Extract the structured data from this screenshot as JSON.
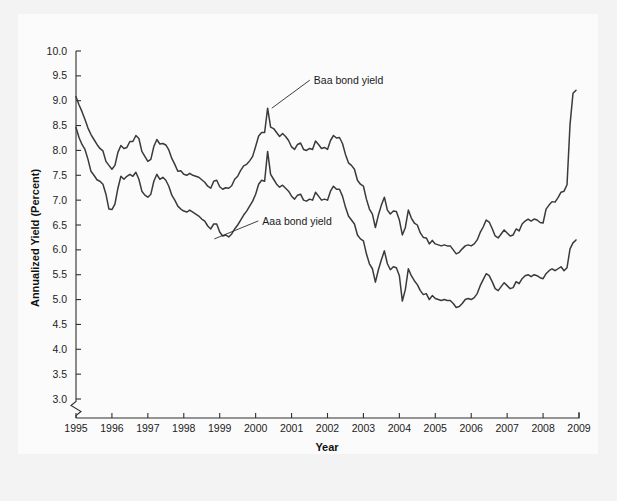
{
  "figure": {
    "background_color": "#f3f3f3",
    "plot_background_color": "#fdfdfd",
    "line_color": "#3a3a3a",
    "axis_color": "#2f2f2f"
  },
  "chart_data": {
    "type": "line",
    "title": "",
    "xlabel": "Year",
    "ylabel": "Annualized Yield (Percent)",
    "xlim": [
      1995,
      2009
    ],
    "ylim": [
      2.75,
      10.0
    ],
    "y_axis_break": true,
    "y_axis_break_below": 3.0,
    "grid": false,
    "legend_position": "inline-annotations",
    "xticks": [
      1995,
      1996,
      1997,
      1998,
      1999,
      2000,
      2001,
      2002,
      2003,
      2004,
      2005,
      2006,
      2007,
      2008,
      2009
    ],
    "xtick_labels": [
      "1995",
      "1996",
      "1997",
      "1998",
      "1999",
      "2000",
      "2001",
      "2002",
      "2003",
      "2004",
      "2005",
      "2006",
      "2007",
      "2008",
      "2009"
    ],
    "yticks": [
      3.0,
      3.5,
      4.0,
      4.5,
      5.0,
      5.5,
      6.0,
      6.5,
      7.0,
      7.5,
      8.0,
      8.5,
      9.0,
      9.5,
      10.0
    ],
    "ytick_labels": [
      "3.0",
      "3.5",
      "4.0",
      "4.5",
      "5.0",
      "5.5",
      "6.0",
      "6.5",
      "7.0",
      "7.5",
      "8.0",
      "8.5",
      "9.0",
      "9.5",
      "10.0"
    ],
    "annotations": [
      {
        "text": "Baa bond yield",
        "series": "Baa bond yield",
        "x": 2000.45,
        "y": 8.85
      },
      {
        "text": "Aaa bond yield",
        "series": "Aaa bond yield",
        "x": 1998.85,
        "y": 6.22
      }
    ],
    "x_start": 1995.0,
    "x_step_months": 1,
    "series": [
      {
        "name": "Baa bond yield",
        "values": [
          9.08,
          8.92,
          8.78,
          8.62,
          8.45,
          8.32,
          8.22,
          8.12,
          8.04,
          7.99,
          7.78,
          7.7,
          7.62,
          7.7,
          7.96,
          8.1,
          8.04,
          8.06,
          8.18,
          8.18,
          8.3,
          8.24,
          7.98,
          7.88,
          7.78,
          7.82,
          8.08,
          8.22,
          8.13,
          8.14,
          8.11,
          8.01,
          7.84,
          7.72,
          7.58,
          7.59,
          7.52,
          7.5,
          7.54,
          7.5,
          7.48,
          7.46,
          7.41,
          7.36,
          7.28,
          7.24,
          7.38,
          7.4,
          7.27,
          7.22,
          7.25,
          7.24,
          7.29,
          7.42,
          7.48,
          7.6,
          7.69,
          7.72,
          7.79,
          7.88,
          8.08,
          8.29,
          8.36,
          8.36,
          8.85,
          8.47,
          8.44,
          8.36,
          8.28,
          8.34,
          8.28,
          8.2,
          8.07,
          8.02,
          8.12,
          8.15,
          8.02,
          8.0,
          8.04,
          8.02,
          8.19,
          8.12,
          8.04,
          8.06,
          8.02,
          8.2,
          8.3,
          8.25,
          8.26,
          8.14,
          7.92,
          7.75,
          7.7,
          7.62,
          7.4,
          7.32,
          7.28,
          7.02,
          6.82,
          6.72,
          6.45,
          6.7,
          6.9,
          7.06,
          6.8,
          6.72,
          6.78,
          6.77,
          6.6,
          6.3,
          6.45,
          6.8,
          6.64,
          6.54,
          6.5,
          6.34,
          6.25,
          6.24,
          6.12,
          6.19,
          6.12,
          6.1,
          6.08,
          6.1,
          6.08,
          6.08,
          6.0,
          5.92,
          5.95,
          6.02,
          6.08,
          6.1,
          6.08,
          6.12,
          6.2,
          6.35,
          6.46,
          6.6,
          6.56,
          6.43,
          6.28,
          6.24,
          6.32,
          6.4,
          6.34,
          6.28,
          6.3,
          6.42,
          6.38,
          6.52,
          6.58,
          6.62,
          6.58,
          6.62,
          6.6,
          6.55,
          6.54,
          6.82,
          6.9,
          6.97,
          6.96,
          7.05,
          7.16,
          7.18,
          7.31,
          8.52,
          9.15,
          9.21
        ]
      },
      {
        "name": "Aaa bond yield",
        "values": [
          8.46,
          8.26,
          8.12,
          8.02,
          7.82,
          7.58,
          7.5,
          7.41,
          7.38,
          7.32,
          7.12,
          6.82,
          6.81,
          6.92,
          7.24,
          7.48,
          7.42,
          7.48,
          7.52,
          7.48,
          7.56,
          7.42,
          7.18,
          7.1,
          7.06,
          7.12,
          7.38,
          7.52,
          7.42,
          7.46,
          7.4,
          7.28,
          7.1,
          7.0,
          6.88,
          6.82,
          6.78,
          6.76,
          6.8,
          6.76,
          6.72,
          6.68,
          6.62,
          6.58,
          6.48,
          6.42,
          6.52,
          6.52,
          6.36,
          6.28,
          6.3,
          6.26,
          6.32,
          6.42,
          6.5,
          6.6,
          6.7,
          6.78,
          6.88,
          6.98,
          7.12,
          7.32,
          7.4,
          7.38,
          7.98,
          7.52,
          7.42,
          7.32,
          7.26,
          7.3,
          7.24,
          7.18,
          7.08,
          7.02,
          7.1,
          7.12,
          7.0,
          6.98,
          7.02,
          7.0,
          7.16,
          7.08,
          7.0,
          7.02,
          7.0,
          7.18,
          7.28,
          7.22,
          7.22,
          7.08,
          6.86,
          6.68,
          6.6,
          6.52,
          6.3,
          6.22,
          6.18,
          5.92,
          5.72,
          5.62,
          5.35,
          5.6,
          5.8,
          5.98,
          5.72,
          5.6,
          5.66,
          5.64,
          5.48,
          4.97,
          5.2,
          5.62,
          5.48,
          5.38,
          5.3,
          5.18,
          5.1,
          5.12,
          5.0,
          5.08,
          5.02,
          5.0,
          4.98,
          5.0,
          4.98,
          4.98,
          4.92,
          4.84,
          4.86,
          4.92,
          5.0,
          5.02,
          5.0,
          5.04,
          5.12,
          5.28,
          5.4,
          5.52,
          5.48,
          5.36,
          5.22,
          5.18,
          5.26,
          5.34,
          5.28,
          5.22,
          5.24,
          5.36,
          5.32,
          5.42,
          5.48,
          5.5,
          5.46,
          5.5,
          5.48,
          5.44,
          5.42,
          5.52,
          5.58,
          5.62,
          5.58,
          5.62,
          5.66,
          5.58,
          5.64,
          6.02,
          6.14,
          6.2
        ]
      }
    ]
  }
}
